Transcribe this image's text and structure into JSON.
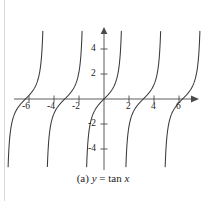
{
  "figure": {
    "caption_prefix": "(a)",
    "caption_lhs": "y",
    "caption_eq": "=",
    "caption_fn": "tan",
    "caption_var": "x",
    "caption_full": "(a) y = tan x"
  },
  "colors": {
    "background": "#ffffff",
    "axis": "#4a4a4a",
    "curve": "#3a3a3a",
    "text": "#1a1a1a",
    "rule": "#d8d8d8"
  },
  "chart_data": {
    "type": "line",
    "title": "(a) y = tan x",
    "function": "y = tan x",
    "xlabel": "x",
    "ylabel": "y",
    "xlim": [
      -7.4,
      7.4
    ],
    "ylim": [
      -5.6,
      5.6
    ],
    "grid": false,
    "legend": null,
    "x_ticks": [
      -6,
      -4,
      -2,
      2,
      4,
      6
    ],
    "x_tick_labels": [
      "-6",
      "-4",
      "-2",
      "2",
      "4",
      "6"
    ],
    "y_ticks": [
      -4,
      -2,
      2,
      4
    ],
    "y_tick_labels": [
      "-4",
      "-2",
      "2",
      "4"
    ],
    "asymptotes": [
      -7.854,
      -4.712,
      -1.571,
      1.571,
      4.712,
      7.854
    ],
    "branches": [
      {
        "x_start": -7.854,
        "x_end": -4.712,
        "center": -6.283
      },
      {
        "x_start": -4.712,
        "x_end": -1.571,
        "center": -3.142
      },
      {
        "x_start": -1.571,
        "x_end": 1.571,
        "center": 0
      },
      {
        "x_start": 1.571,
        "x_end": 4.712,
        "center": 3.142
      },
      {
        "x_start": 4.712,
        "x_end": 7.854,
        "center": 6.283
      }
    ],
    "period": 3.14159,
    "axis_arrows": [
      "x-positive",
      "y-positive"
    ]
  },
  "geometry": {
    "origin_px": [
      104,
      99
    ],
    "x_scale_px_per_unit": 12.5,
    "y_scale_px_per_unit": 12.5,
    "y_clip": [
      -5.6,
      5.6
    ]
  }
}
